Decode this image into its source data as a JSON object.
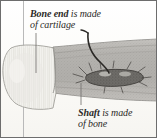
{
  "figure": {
    "name": "bone-anatomy-diagram",
    "type": "anatomical-illustration",
    "background_color": "#fdfdfb",
    "border_color": "#6d6d6d",
    "column_rule_color": "#b9b9b9"
  },
  "labels": {
    "bone_end": {
      "line1_strong": "Bone end",
      "line1_rest": " is made",
      "line2": "of cartilage"
    },
    "shaft": {
      "line1_strong": "Shaft",
      "line1_rest": " is made",
      "line2": "of bone"
    }
  },
  "structures": [
    {
      "name": "bone-end-cartilage",
      "description": "rounded pale epiphysis with vertical striations",
      "fill": "#efeeea",
      "stroke": "#9a9a96"
    },
    {
      "name": "bone-shaft",
      "description": "stippled grey diaphysis cylinder",
      "fill": "#b0aeaa",
      "stroke": "#7c7a76"
    },
    {
      "name": "marrow-cavity",
      "description": "dark elongated interior cavity",
      "fill": "#5d5b57",
      "stroke": "#3c3a37"
    },
    {
      "name": "blood-vessel",
      "description": "dark curved vessel entering the shaft from above",
      "stroke": "#2b2926"
    }
  ],
  "leader_lines": [
    {
      "name": "leader-bone-end",
      "from_label": "bone_end",
      "to_structure": "bone-end-cartilage"
    },
    {
      "name": "leader-shaft",
      "from_label": "shaft",
      "to_structure": "bone-shaft"
    }
  ]
}
